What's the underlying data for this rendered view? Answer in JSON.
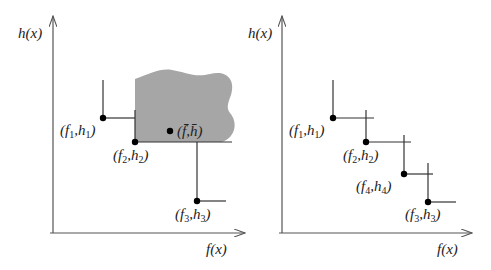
{
  "panels": [
    {
      "id": "left",
      "y_axis_label": "h(x)",
      "x_axis_label": "f(x)",
      "shaded_region": true,
      "points": [
        {
          "f": "f",
          "fsub": "1",
          "h": "h",
          "hsub": "1",
          "label": "(f1,h1)"
        },
        {
          "f": "f",
          "fsub": "2",
          "h": "h",
          "hsub": "2",
          "label": "(f2,h2)"
        },
        {
          "f": "f",
          "fsub": "3",
          "h": "h",
          "hsub": "3",
          "label": "(f3,h3)"
        }
      ],
      "mean_point": {
        "label": "(f̄,h̄)",
        "f": "f̄",
        "h": "h̄"
      }
    },
    {
      "id": "right",
      "y_axis_label": "h(x)",
      "x_axis_label": "f(x)",
      "shaded_region": false,
      "points": [
        {
          "f": "f",
          "fsub": "1",
          "h": "h",
          "hsub": "1",
          "label": "(f1,h1)"
        },
        {
          "f": "f",
          "fsub": "2",
          "h": "h",
          "hsub": "2",
          "label": "(f2,h2)"
        },
        {
          "f": "f",
          "fsub": "4",
          "h": "h",
          "hsub": "4",
          "label": "(f4,h4)"
        },
        {
          "f": "f",
          "fsub": "3",
          "h": "h",
          "hsub": "3",
          "label": "(f3,h3)"
        }
      ]
    }
  ],
  "colors": {
    "shaded_region": "#a6a6a6",
    "axis": "#555555",
    "points": "#000000"
  }
}
